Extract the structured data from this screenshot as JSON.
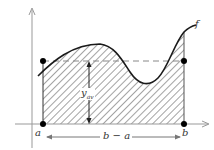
{
  "diagram": {
    "labels": {
      "a": "a",
      "b": "b",
      "interval_width": "b − a",
      "function": "f",
      "average_value_main": "y",
      "average_value_sub": "av"
    },
    "colors": {
      "axis": "#999999",
      "curve": "#1a1a1a",
      "hatch": "#555555",
      "dashed": "#888888",
      "points": "#000000",
      "text": "#333333"
    },
    "elements": [
      "x-axis with arrow",
      "y-axis with arrow",
      "curve f",
      "hatched area under f from a to b",
      "dashed horizontal line at y_av",
      "vertical arrow indicating y_av height",
      "double arrow indicating width b − a",
      "points at (a,0), (b,0), (a,y_av), (b,y_av)"
    ]
  }
}
